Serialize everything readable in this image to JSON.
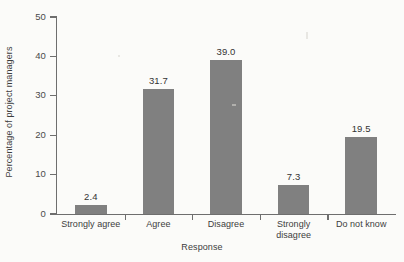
{
  "chart_data": {
    "type": "bar",
    "title": "",
    "subtitle": "",
    "xlabel": "Response",
    "ylabel": "Percentage of project managers",
    "categories": [
      "Strongly agree",
      "Agree",
      "Disagree",
      "Strongly disagree",
      "Do not know"
    ],
    "category_label_lines": [
      [
        "Strongly agree"
      ],
      [
        "Agree"
      ],
      [
        "Disagree"
      ],
      [
        "Strongly",
        "disagree"
      ],
      [
        "Do not know"
      ]
    ],
    "values": [
      2.4,
      31.7,
      39.0,
      7.3,
      19.5
    ],
    "value_labels": [
      "2.4",
      "31.7",
      "39.0",
      "7.3",
      "19.5"
    ],
    "ylim": [
      0,
      50
    ],
    "ytick_values": [
      0,
      10,
      20,
      30,
      40,
      50
    ],
    "ytick_labels": [
      "0",
      "10",
      "20",
      "30",
      "40",
      "50"
    ],
    "grid": false,
    "legend": null,
    "legend_position": "none",
    "bar_color": "#808080",
    "axis_color": "#6e6e6e",
    "text_color": "#3d3d3d",
    "background_color": "#fbfbf9"
  }
}
